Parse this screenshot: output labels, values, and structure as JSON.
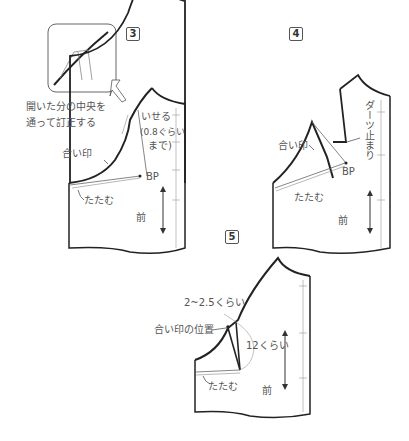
{
  "steps": [
    {
      "number": "3",
      "labels": {
        "instruction_line1": "開いた分の中央を",
        "instruction_line2": "通って訂正する",
        "ease": "いせる",
        "ease_amount": "(0.8ぐらい",
        "ease_until": "まで)",
        "notch": "合い印",
        "bp": "BP",
        "fold": "たたむ",
        "front": "前"
      }
    },
    {
      "number": "4",
      "labels": {
        "dart_end": "ダーツ止まり",
        "notch": "合い印",
        "bp": "BP",
        "fold": "たたむ",
        "front": "前"
      }
    },
    {
      "number": "5",
      "labels": {
        "offset": "2~2.5くらい",
        "notch_position": "合い印の位置",
        "length": "12くらい",
        "fold": "たたむ",
        "front": "前"
      }
    }
  ],
  "colors": {
    "line": "#2b2b2b",
    "thin_line": "#777777",
    "text": "#555555"
  }
}
